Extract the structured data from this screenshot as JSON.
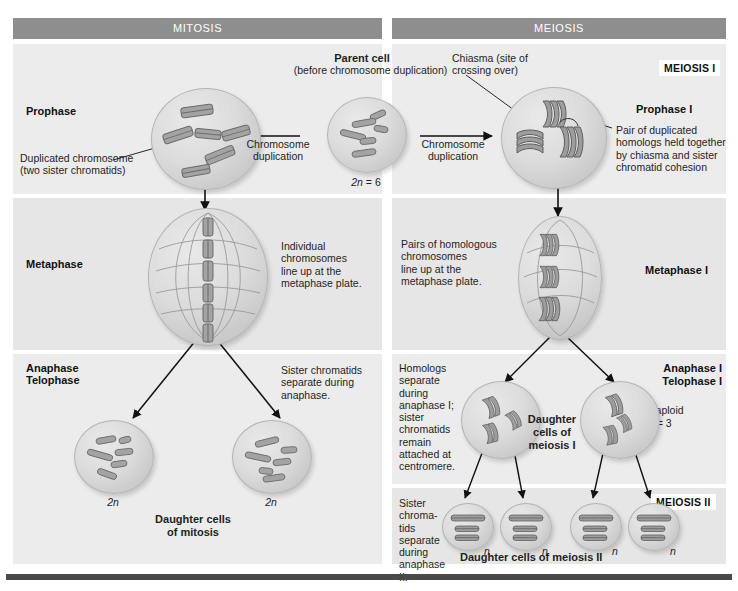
{
  "figure": {
    "columns": [
      {
        "id": "mitosis",
        "label": "MITOSIS"
      },
      {
        "id": "meiosis",
        "label": "MEIOSIS"
      }
    ],
    "section_labels": {
      "meiosis_i": "MEIOSIS I",
      "meiosis_ii": "MEIOSIS II"
    },
    "colors": {
      "header_bar": "#8e8e8e",
      "panel": "#ececec",
      "panel_alt": "#e6e6e6",
      "chromosome": "#a0a0a0",
      "chromosome_outline": "#6f6f6f",
      "cell_fill": "#dcdcdc",
      "rule": "#4a4a4a",
      "text": "#1f1f1f"
    }
  },
  "center": {
    "parent_cell_title": "Parent cell",
    "parent_cell_subtitle": "(before chromosome duplication)",
    "parent_cell_ploidy": "2n = 6",
    "duplication_left": "Chromosome\nduplication",
    "duplication_right": "Chromosome\nduplication"
  },
  "mitosis": {
    "stages": [
      {
        "name": "Prophase"
      },
      {
        "name": "Metaphase"
      },
      {
        "name": "Anaphase\nTelophase"
      }
    ],
    "annotations": {
      "duplicated_chromosome": "Duplicated chromosome\n(two sister chromatids)",
      "metaphase_note": "Individual\nchromosomes\nline up at the\nmetaphase plate.",
      "anaphase_note": "Sister chromatids\nseparate during\nanaphase."
    },
    "daughter_cells": {
      "caption": "Daughter cells\nof mitosis",
      "ploidy_left": "2n",
      "ploidy_right": "2n"
    },
    "cell_contents": {
      "prophase_duplicated_count": 6,
      "metaphase_duplicated_count": 6,
      "daughter_chromosome_count": 6
    }
  },
  "meiosis": {
    "stages": [
      {
        "name": "Prophase I"
      },
      {
        "name": "Metaphase I"
      },
      {
        "name": "Anaphase I\nTelophase I"
      }
    ],
    "annotations": {
      "chiasma": "Chiasma (site of\ncrossing over)",
      "homolog_pair": "Pair of duplicated\nhomologs held together\nby chiasma and sister\nchromatid cohesion",
      "metaphase_note": "Pairs of homologous\nchromosomes\nline up at the\nmetaphase plate.",
      "anaphase_note": "Homologs\nseparate\nduring\nanaphase I;\nsister\nchromatids\nremain\nattached at\ncentromere.",
      "meiosis_ii_note": "Sister\nchroma-\ntids\nseparate\nduring\nanaphase II.",
      "haploid": "Haploid",
      "haploid_n": "n = 3"
    },
    "daughter_cells_i": {
      "caption": "Daughter\ncells of\nmeiosis I"
    },
    "daughter_cells_ii": {
      "caption": "Daughter cells of meiosis II",
      "ploidy": [
        "n",
        "n",
        "n",
        "n"
      ]
    },
    "cell_contents": {
      "prophase_tetrad_count": 3,
      "metaphase_tetrad_count": 3,
      "daughter_i_dyad_count": 3,
      "daughter_ii_chromosome_count": 3
    }
  }
}
